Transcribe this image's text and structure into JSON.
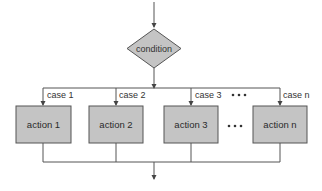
{
  "diagram": {
    "type": "switch-case flowchart",
    "decision": {
      "label": "condition"
    },
    "cases": [
      {
        "case_label": "case 1",
        "action_label": "action 1"
      },
      {
        "case_label": "case 2",
        "action_label": "action 2"
      },
      {
        "case_label": "case 3",
        "action_label": "action 3"
      },
      {
        "case_label": "case n",
        "action_label": "action n"
      }
    ],
    "ellipsis": "• • •",
    "colors": {
      "shape_fill": "#c4c4c4",
      "shape_stroke": "#555555",
      "line": "#555555",
      "background": "#ffffff"
    }
  }
}
